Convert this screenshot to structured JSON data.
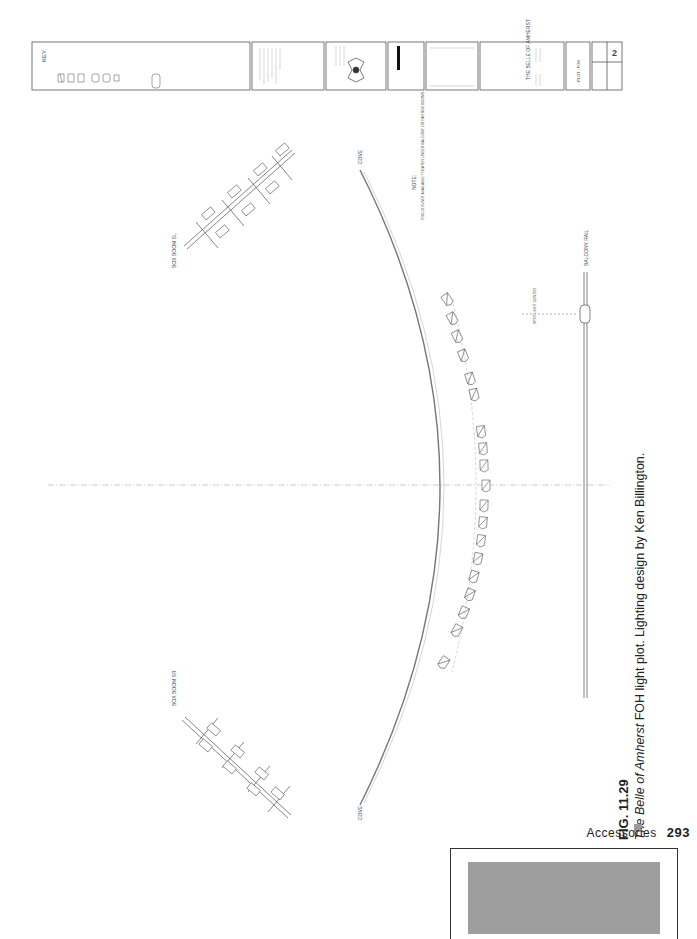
{
  "drawing": {
    "title_block": {
      "key_title": "KEY:",
      "key_items": [
        "SOURCE FOUR 19°",
        "SOURCE FOUR 26°",
        "SOURCE FOUR 36°",
        "PAR 64 MFL",
        "PAR 64 WFL",
        "WORKLIGHT"
      ],
      "key_unit_label": "UNIT #",
      "general_notes_title": "GENERAL NOTES",
      "union_label": "UNITED SCENIC ARTISTS",
      "revisions_title": "REVISIONS",
      "production_title": "THE BELLE OF AMHERST",
      "production_sub": "PRODUCTION",
      "sheet_title": "PLOT - FOH",
      "scale_label": "SCALE: 1/2\" = 1'-0\"",
      "date_label": "DATE",
      "drawn_by_label": "DRAWN: KB",
      "sheet_number": "2",
      "sheet_of": "of 2"
    },
    "labels": {
      "cove_top": "COVE",
      "cove_bottom": "COVE",
      "box_boom_sl": "BOX BOOM SL",
      "box_boom_sr": "BOX BOOM SR",
      "balcony_rail": "BALCONY RAIL",
      "note_title": "NOTE:",
      "note_text": "FOCUS IS NOT AVAILABLE THEATER UNDER BALCONY OR FAR BOX BOOMS",
      "followspot_label": "SPOT LIGHT CENTER"
    }
  },
  "caption": {
    "figure_number": "FIG. 11.29",
    "title_italic": "The Belle of Amherst",
    "text": " FOH light plot. Lighting design by Ken Billington."
  },
  "page": {
    "running_head": "Accessories",
    "page_number": "293"
  }
}
